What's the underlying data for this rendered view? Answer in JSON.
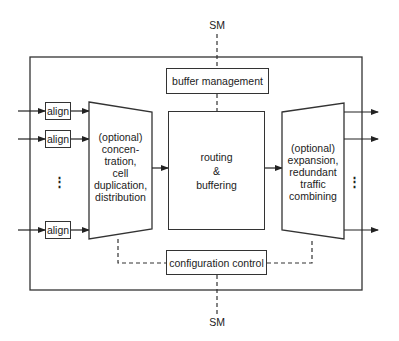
{
  "diagram": {
    "sm_top": "SM",
    "sm_bottom": "SM",
    "buffer_management": "buffer management",
    "configuration_control": "configuration control",
    "routing": "routing\n&\nbuffering",
    "left_stage": "(optional)\nconcen-\ntration,\ncell\nduplication,\ndistribution",
    "right_stage": "(optional)\nexpansion,\nredundant\ntraffic\ncombining",
    "align_blocks": [
      "align",
      "align",
      "align"
    ],
    "input_ellipsis": "⋮",
    "output_ellipsis": "⋮"
  }
}
